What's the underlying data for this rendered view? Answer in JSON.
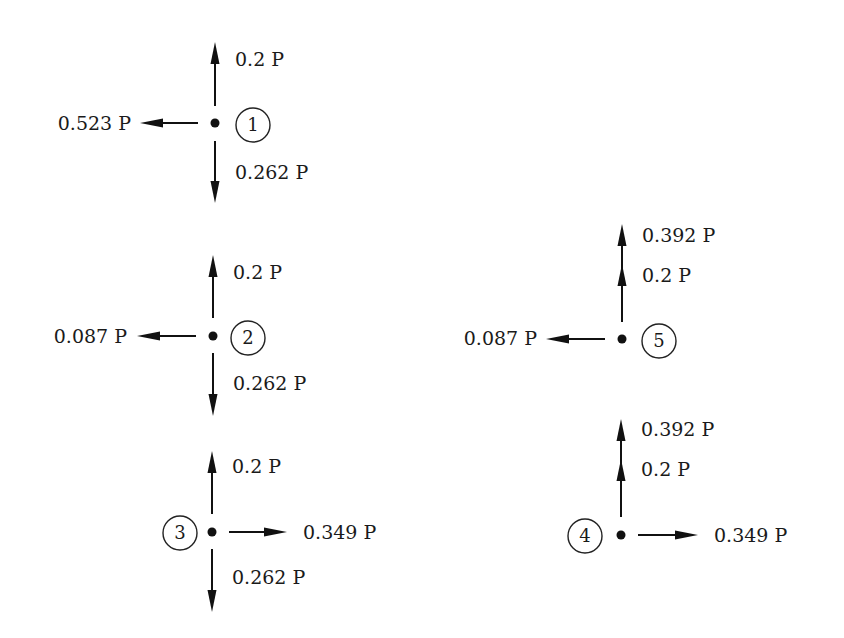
{
  "diagram": {
    "type": "free-body force diagrams at joints",
    "unit_symbol": "P",
    "nodes": [
      {
        "id": "1",
        "label": "1",
        "forces": [
          {
            "direction": "up",
            "label": "0.2 P"
          },
          {
            "direction": "down",
            "label": "0.262 P"
          },
          {
            "direction": "left",
            "label": "0.523 P"
          }
        ]
      },
      {
        "id": "2",
        "label": "2",
        "forces": [
          {
            "direction": "up",
            "label": "0.2 P"
          },
          {
            "direction": "down",
            "label": "0.262 P"
          },
          {
            "direction": "left",
            "label": "0.087 P"
          }
        ]
      },
      {
        "id": "3",
        "label": "3",
        "forces": [
          {
            "direction": "up",
            "label": "0.2 P"
          },
          {
            "direction": "down",
            "label": "0.262 P"
          },
          {
            "direction": "right",
            "label": "0.349 P"
          }
        ]
      },
      {
        "id": "4",
        "label": "4",
        "forces": [
          {
            "direction": "up",
            "label": "0.392 P"
          },
          {
            "direction": "up",
            "label": "0.2 P"
          },
          {
            "direction": "right",
            "label": "0.349 P"
          }
        ]
      },
      {
        "id": "5",
        "label": "5",
        "forces": [
          {
            "direction": "up",
            "label": "0.392 P"
          },
          {
            "direction": "up",
            "label": "0.2 P"
          },
          {
            "direction": "left",
            "label": "0.087 P"
          }
        ]
      }
    ]
  }
}
